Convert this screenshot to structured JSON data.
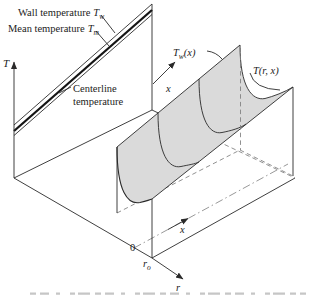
{
  "colors": {
    "line": "#2a2a2a",
    "thick_line": "#141414",
    "hidden": "#7d7d7d",
    "surface_fill": "#dadada",
    "text": "#1c1c1c",
    "caption_fragment": "#c6c6c6",
    "background": "#ffffff"
  },
  "labels": {
    "wall_temperature": {
      "prefix": "Wall temperature",
      "sym": "T",
      "sub": "w"
    },
    "mean_temperature": {
      "prefix": "Mean temperature",
      "sym": "T",
      "sub": "m"
    },
    "centerline_temperature": {
      "line1": "Centerline",
      "line2": "temperature"
    },
    "t_axis": "T",
    "x_axis_upper": "x",
    "x_axis_floor": "x",
    "r_axis": "r",
    "origin": "0",
    "tube_radius": {
      "sym": "r",
      "sub": "o"
    },
    "wall_temp_profile": {
      "sym": "T",
      "sub": "w",
      "args": "(x)"
    },
    "temp_distribution": {
      "sym": "T",
      "args": "(r, x)"
    }
  }
}
